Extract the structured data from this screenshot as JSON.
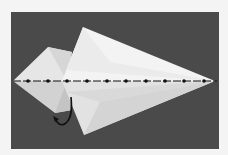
{
  "diagram": {
    "type": "origami-step",
    "colors": {
      "page_background": "#f4f4f4",
      "photo_background": "#4a4a4a",
      "paper_light": "#f2f2f2",
      "paper_mid": "#dcdcdc",
      "paper_shade": "#c8c8c8",
      "fold_line": "#111111",
      "arrow": "#111111"
    },
    "fold_line": {
      "style": "dash-dot",
      "y": 81,
      "x_start": 13,
      "x_end": 217,
      "dots_x": [
        28,
        48,
        67,
        87,
        107,
        126,
        146,
        165,
        184,
        204
      ]
    },
    "arrow": {
      "kind": "curved-fold-arrow",
      "direction": "tuck-under-left"
    }
  }
}
